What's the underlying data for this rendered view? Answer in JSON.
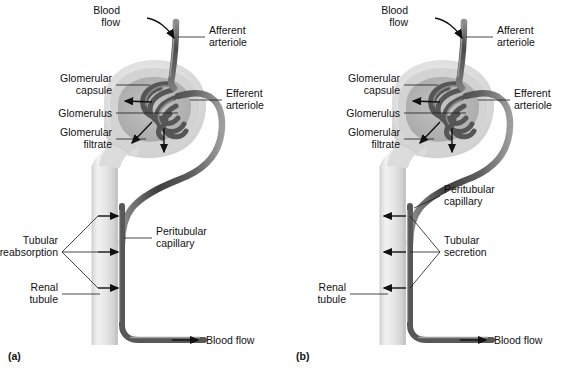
{
  "figure": {
    "background_color": "#ffffff",
    "text_color": "#111111"
  },
  "colors": {
    "arteriole_dark": "#4a4a4a",
    "arteriole_mid": "#6e6e6e",
    "arteriole_light": "#a8a8a8",
    "capsule_outer": "#e2e2e2",
    "capsule_inner": "#c9c9c9",
    "filtrate_space": "#b9b9b9",
    "tubule_light": "#ededed",
    "tubule_shadow": "#cfcfcf",
    "capillary_dark": "#5a5a5a",
    "leader_line": "#1a1a1a"
  },
  "panels": [
    {
      "id": "a",
      "tag": "(a)",
      "process": "Tubular reabsorption",
      "arrow_direction": "right",
      "labels": {
        "blood_flow_top": "Blood\nflow",
        "blood_flow_top_line1": "Blood",
        "blood_flow_top_line2": "flow",
        "afferent_line1": "Afferent",
        "afferent_line2": "arteriole",
        "efferent_line1": "Efferent",
        "efferent_line2": "arteriole",
        "glomerular_capsule_line1": "Glomerular",
        "glomerular_capsule_line2": "capsule",
        "glomerulus": "Glomerulus",
        "glomerular_filtrate_line1": "Glomerular",
        "glomerular_filtrate_line2": "filtrate",
        "process_line1": "Tubular",
        "process_line2": "reabsorption",
        "peritubular_line1": "Peritubular",
        "peritubular_line2": "capillary",
        "renal_tubule_line1": "Renal",
        "renal_tubule_line2": "tubule",
        "blood_flow_bottom": "Blood flow"
      }
    },
    {
      "id": "b",
      "tag": "(b)",
      "process": "Tubular secretion",
      "arrow_direction": "left",
      "labels": {
        "blood_flow_top_line1": "Blood",
        "blood_flow_top_line2": "flow",
        "afferent_line1": "Afferent",
        "afferent_line2": "arteriole",
        "efferent_line1": "Efferent",
        "efferent_line2": "arteriole",
        "glomerular_capsule_line1": "Glomerular",
        "glomerular_capsule_line2": "capsule",
        "glomerulus": "Glomerulus",
        "glomerular_filtrate_line1": "Glomerular",
        "glomerular_filtrate_line2": "filtrate",
        "process_line1": "Tubular",
        "process_line2": "secretion",
        "peritubular_line1": "Peritubular",
        "peritubular_line2": "capillary",
        "renal_tubule_line1": "Renal",
        "renal_tubule_line2": "tubule",
        "blood_flow_bottom": "Blood flow"
      }
    }
  ]
}
